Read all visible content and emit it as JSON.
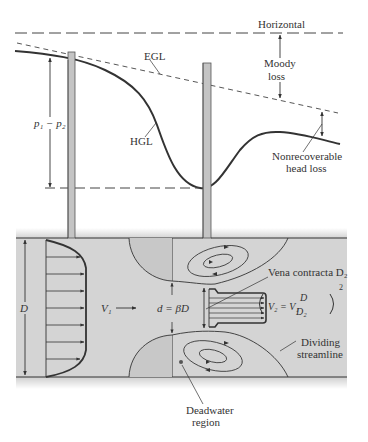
{
  "figure": {
    "type": "orifice meter flow diagram",
    "labels": {
      "horizontal": "Horizontal",
      "egl": "EGL",
      "hgl": "HGL",
      "moody_loss_1": "Moody",
      "moody_loss_2": "loss",
      "pressure_drop": "p₁ − p₂",
      "nonrecoverable_1": "Nonrecoverable",
      "nonrecoverable_2": "head loss",
      "pipe_diameter": "D",
      "upstream_velocity": "V₁",
      "orifice_diameter": "d = βD",
      "vena_contracta": "Vena contracta D₂",
      "downstream_velocity_eq": "V₂ = V₁",
      "eq_num": "D",
      "eq_den": "D₂",
      "eq_exp": "2",
      "dividing_1": "Dividing",
      "dividing_2": "streamline",
      "deadwater_1": "Deadwater",
      "deadwater_2": "region"
    },
    "colors": {
      "line": "#333333",
      "pipe_fill": "#d4d4d4",
      "tap_fill": "#c4c4c4",
      "background": "#ffffff"
    }
  }
}
